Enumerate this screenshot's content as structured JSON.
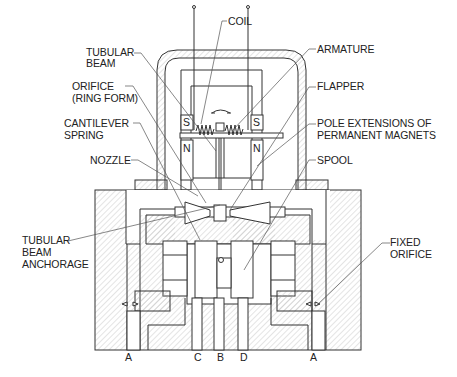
{
  "diagram": {
    "type": "cross-section",
    "colors": {
      "line": "#333333",
      "hatch": "#b0b0b0",
      "leader": "#555555",
      "background": "#ffffff"
    }
  },
  "labels": {
    "coil": "COIL",
    "tubular_beam_1": "TUBULAR",
    "tubular_beam_2": "BEAM",
    "orifice_1": "ORIFICE",
    "orifice_2": "(RING FORM)",
    "cantilever_1": "CANTILEVER",
    "cantilever_2": "SPRING",
    "nozzle": "NOZZLE",
    "anchorage_1": "TUBULAR",
    "anchorage_2": "BEAM",
    "anchorage_3": "ANCHORAGE",
    "armature": "ARMATURE",
    "flapper": "FLAPPER",
    "pole_1": "POLE EXTENSIONS OF",
    "pole_2": "PERMANENT MAGNETS",
    "spool": "SPOOL",
    "fixed_orifice_1": "FIXED",
    "fixed_orifice_2": "ORIFICE"
  },
  "magnets": {
    "s_left": "S",
    "s_right": "S",
    "n_left": "N",
    "n_right": "N"
  },
  "ports": {
    "a_left": "A",
    "c": "C",
    "b": "B",
    "d": "D",
    "a_right": "A"
  }
}
